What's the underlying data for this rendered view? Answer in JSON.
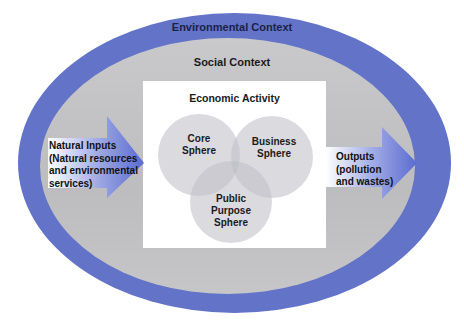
{
  "diagram": {
    "layers": {
      "environmental": {
        "label": "Environmental Context",
        "color": "#6373c8"
      },
      "social": {
        "label": "Social Context",
        "color": "#c4c4c6"
      },
      "economic": {
        "label": "Economic Activity",
        "color": "#ffffff"
      }
    },
    "spheres": [
      {
        "line1": "Core",
        "line2": "Sphere",
        "line3": ""
      },
      {
        "line1": "Business",
        "line2": "Sphere",
        "line3": ""
      },
      {
        "line1": "Public",
        "line2": "Purpose",
        "line3": "Sphere"
      }
    ],
    "inputs": {
      "lines": [
        "Natural Inputs",
        "(Natural resources",
        "and environmental",
        "services)"
      ]
    },
    "outputs": {
      "lines": [
        "Outputs",
        "(pollution",
        "and wastes)"
      ]
    },
    "arrow_color": "#5a6bd0"
  }
}
